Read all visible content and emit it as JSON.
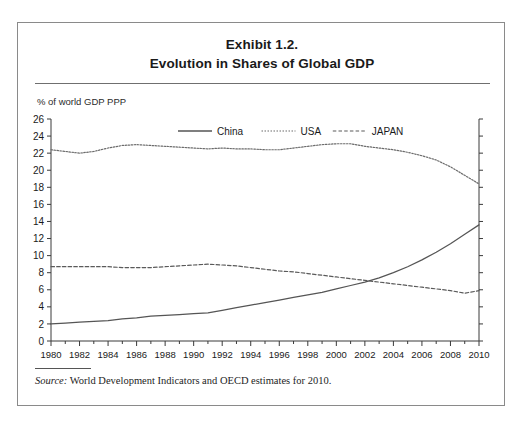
{
  "figure": {
    "title_line1": "Exhibit 1.2.",
    "title_line2": "Evolution in Shares of Global GDP",
    "axis_caption": "% of world GDP PPP",
    "source_label": "Source:",
    "source_text": " World Development Indicators and OECD estimates for 2010."
  },
  "colors": {
    "frame": "#8a8a8a",
    "axis": "#3a3a3a",
    "series_china": "#555555",
    "series_usa": "#6b6b6b",
    "series_japan": "#5a5a5a",
    "text": "#1a1a1a"
  },
  "chart_data": {
    "type": "line",
    "title": "Evolution in Shares of Global GDP",
    "subtitle": "Exhibit 1.2.",
    "xlabel": "",
    "ylabel": "% of world GDP PPP",
    "xlim": [
      1980,
      2010
    ],
    "ylim": [
      0,
      26
    ],
    "ytick_step": 2,
    "yticks": [
      0,
      2,
      4,
      6,
      8,
      10,
      12,
      14,
      16,
      18,
      20,
      22,
      24,
      26
    ],
    "xticks": [
      1980,
      1982,
      1984,
      1986,
      1988,
      1990,
      1992,
      1994,
      1996,
      1998,
      2000,
      2002,
      2004,
      2006,
      2008,
      2010
    ],
    "x_minor_step": 1,
    "grid": false,
    "legend_position": "top-center-inside",
    "x": [
      1980,
      1981,
      1982,
      1983,
      1984,
      1985,
      1986,
      1987,
      1988,
      1989,
      1990,
      1991,
      1992,
      1993,
      1994,
      1995,
      1996,
      1997,
      1998,
      1999,
      2000,
      2001,
      2002,
      2003,
      2004,
      2005,
      2006,
      2007,
      2008,
      2009,
      2010
    ],
    "series": [
      {
        "name": "China",
        "style": "solid",
        "values": [
          2.0,
          2.1,
          2.2,
          2.3,
          2.4,
          2.6,
          2.7,
          2.9,
          3.0,
          3.1,
          3.2,
          3.3,
          3.6,
          3.9,
          4.2,
          4.5,
          4.8,
          5.1,
          5.4,
          5.7,
          6.1,
          6.5,
          6.9,
          7.4,
          8.0,
          8.7,
          9.5,
          10.4,
          11.4,
          12.5,
          13.6
        ]
      },
      {
        "name": "USA",
        "style": "dotted",
        "values": [
          22.4,
          22.2,
          22.0,
          22.2,
          22.6,
          22.9,
          23.0,
          22.9,
          22.8,
          22.7,
          22.6,
          22.5,
          22.6,
          22.5,
          22.5,
          22.4,
          22.4,
          22.6,
          22.8,
          23.0,
          23.1,
          23.1,
          22.8,
          22.6,
          22.4,
          22.1,
          21.7,
          21.2,
          20.4,
          19.4,
          18.4
        ]
      },
      {
        "name": "JAPAN",
        "style": "dashed",
        "values": [
          8.7,
          8.7,
          8.7,
          8.7,
          8.7,
          8.6,
          8.6,
          8.6,
          8.7,
          8.8,
          8.9,
          9.0,
          8.9,
          8.8,
          8.6,
          8.4,
          8.2,
          8.1,
          7.9,
          7.7,
          7.5,
          7.3,
          7.1,
          6.9,
          6.7,
          6.5,
          6.3,
          6.1,
          5.9,
          5.6,
          5.9
        ]
      }
    ],
    "legend": [
      {
        "label": "China",
        "style": "solid"
      },
      {
        "label": "USA",
        "style": "dotted"
      },
      {
        "label": "JAPAN",
        "style": "dashed"
      }
    ]
  }
}
